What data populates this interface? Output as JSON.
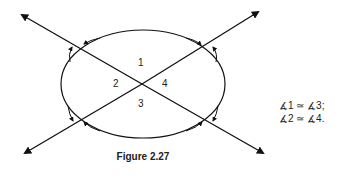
{
  "figure": {
    "caption": "Figure 2.27",
    "angle_labels": [
      "1",
      "2",
      "3",
      "4"
    ],
    "relations": [
      "∡1 ≃ ∡3;",
      "∡2 ≃ ∡4."
    ]
  }
}
